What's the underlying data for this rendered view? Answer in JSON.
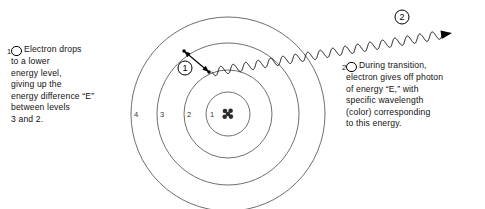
{
  "figure": {
    "background_color": "#ffffff",
    "line_color": "#555555",
    "ink_color": "#000000"
  },
  "captions": {
    "left": {
      "marker": "1",
      "lines": [
        "Electron drops",
        "to a lower",
        "energy level,",
        "giving up the",
        "energy difference “E”",
        "between levels",
        "3 and 2."
      ]
    },
    "right": {
      "marker": "2",
      "lines": [
        "During transition,",
        "electron gives off photon",
        "of energy “E,” with",
        "specific wavelength",
        "(color) corresponding",
        "to this energy."
      ]
    }
  },
  "atom": {
    "center": {
      "x": 228,
      "y": 114
    },
    "nucleus": {
      "label": "nucleus",
      "particle_count": 5,
      "particle_radius": 2.3,
      "color": "#2b2b2b",
      "offsets": [
        {
          "dx": -3.0,
          "dy": -3.0
        },
        {
          "dx": 2.6,
          "dy": -3.2
        },
        {
          "dx": -3.3,
          "dy": 2.8
        },
        {
          "dx": 2.9,
          "dy": 2.6
        },
        {
          "dx": 0.0,
          "dy": 0.0
        }
      ]
    },
    "shells": [
      {
        "label": "1",
        "radius": 22,
        "label_x": 212,
        "label_y": 114
      },
      {
        "label": "2",
        "radius": 44,
        "label_x": 189,
        "label_y": 114
      },
      {
        "label": "3",
        "radius": 71,
        "label_x": 162,
        "label_y": 114
      },
      {
        "label": "4",
        "radius": 97,
        "label_x": 136,
        "label_y": 114
      }
    ]
  },
  "transition": {
    "badge": "1",
    "badge_x": 185,
    "badge_y": 68,
    "arrow": {
      "from": {
        "x": 184,
        "y": 51
      },
      "to": {
        "x": 209,
        "y": 72
      },
      "double_headed": true,
      "endpoint_dots": true
    }
  },
  "photon": {
    "badge": "2",
    "badge_x": 402,
    "badge_y": 17,
    "wave": {
      "start": {
        "x": 212,
        "y": 72
      },
      "end": {
        "x": 452,
        "y": 33
      },
      "amplitude": 4.2,
      "wavelength": 12.6,
      "arrowhead": true
    }
  }
}
